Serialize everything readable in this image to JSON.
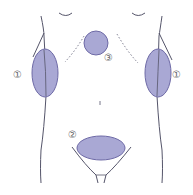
{
  "diagram": {
    "title": "",
    "colors": {
      "outline": "#55556a",
      "region_fill": "#a9a8d4",
      "region_stroke": "#6e6aa6",
      "label_text": "#666666",
      "dotted": "#77778a"
    },
    "regions": [
      {
        "id": "1",
        "label": "①",
        "name": "left-flank-region",
        "shape": "ellipse",
        "cx": 45,
        "cy": 73,
        "rx": 13,
        "ry": 24
      },
      {
        "id": "1",
        "label": "①",
        "name": "right-flank-region",
        "shape": "ellipse",
        "cx": 158,
        "cy": 73,
        "rx": 13,
        "ry": 24
      },
      {
        "id": "2",
        "label": "②",
        "name": "lower-abdomen-region",
        "shape": "ellipse",
        "cx": 101,
        "cy": 148,
        "rx": 24,
        "ry": 12
      },
      {
        "id": "3",
        "label": "③",
        "name": "upper-chest-region",
        "shape": "circle",
        "cx": 96,
        "cy": 43,
        "r": 12
      }
    ],
    "labels": [
      {
        "text": "①",
        "x": 18,
        "y": 70
      },
      {
        "text": "①",
        "x": 174,
        "y": 70
      },
      {
        "text": "②",
        "x": 69,
        "y": 130
      },
      {
        "text": "③",
        "x": 106,
        "y": 53
      }
    ]
  }
}
